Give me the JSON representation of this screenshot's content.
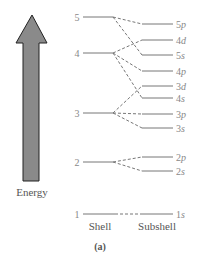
{
  "diagram": {
    "axis_label": "Energy",
    "shell_header": "Shell",
    "subshell_header": "Subshell",
    "caption": "(a)",
    "colors": {
      "arrow_fill": "#8a8a8a",
      "arrow_stroke": "#222222",
      "line": "#777777",
      "text": "#888888"
    },
    "shells": [
      {
        "label": "5",
        "y": 17
      },
      {
        "label": "4",
        "y": 53
      },
      {
        "label": "3",
        "y": 113
      },
      {
        "label": "2",
        "y": 162
      },
      {
        "label": "1",
        "y": 214
      }
    ],
    "subshells": [
      {
        "n": "5",
        "l": "p",
        "y": 24,
        "shell": 0
      },
      {
        "n": "4",
        "l": "d",
        "y": 40,
        "shell": 1
      },
      {
        "n": "5",
        "l": "s",
        "y": 55,
        "shell": 0
      },
      {
        "n": "4",
        "l": "p",
        "y": 71,
        "shell": 1
      },
      {
        "n": "3",
        "l": "d",
        "y": 86,
        "shell": 2
      },
      {
        "n": "4",
        "l": "s",
        "y": 98,
        "shell": 1
      },
      {
        "n": "3",
        "l": "p",
        "y": 114,
        "shell": 2
      },
      {
        "n": "3",
        "l": "s",
        "y": 128,
        "shell": 2
      },
      {
        "n": "2",
        "l": "p",
        "y": 157,
        "shell": 3
      },
      {
        "n": "2",
        "l": "s",
        "y": 171,
        "shell": 3
      },
      {
        "n": "1",
        "l": "s",
        "y": 214,
        "shell": 4
      }
    ]
  }
}
